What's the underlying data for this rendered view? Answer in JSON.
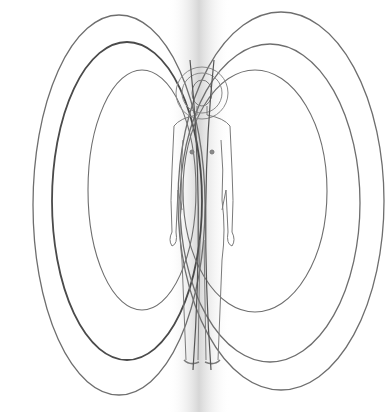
{
  "illustration": {
    "subject": "human figure surrounded by elliptical energy field lines",
    "colors": {
      "background": "#ffffff",
      "line": "#6e6e6e",
      "line_dark": "#4a4a4a",
      "glow": "#cfcfcf"
    },
    "left_ellipses": [
      {
        "cx": 119,
        "cy": 205,
        "rx": 86,
        "ry": 190,
        "weight": 1.3
      },
      {
        "cx": 127,
        "cy": 201,
        "rx": 75,
        "ry": 159,
        "weight": 1.8
      },
      {
        "cx": 142,
        "cy": 190,
        "rx": 54,
        "ry": 120,
        "weight": 1.1
      }
    ],
    "right_ellipses": [
      {
        "cx": 281,
        "cy": 201,
        "rx": 103,
        "ry": 189,
        "weight": 1.3
      },
      {
        "cx": 270,
        "cy": 203,
        "rx": 90,
        "ry": 159,
        "weight": 1.3
      },
      {
        "cx": 255,
        "cy": 191,
        "rx": 72,
        "ry": 121,
        "weight": 1.1
      }
    ]
  }
}
